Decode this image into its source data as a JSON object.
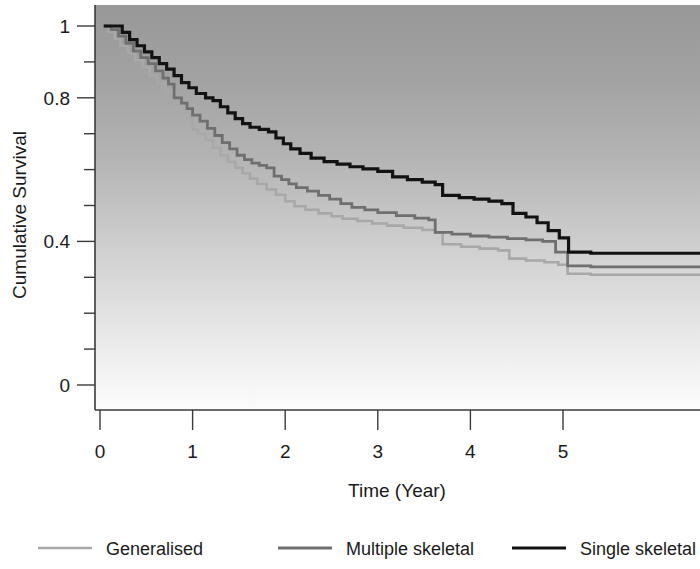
{
  "chart_data": {
    "type": "line",
    "subtype": "kaplan-meier-step",
    "title": "",
    "xlabel": "Time (Year)",
    "ylabel": "Cumulative Survival",
    "xlim": [
      0,
      5.3
    ],
    "ylim": [
      0,
      1.05
    ],
    "xticks": [
      0,
      1,
      2,
      3,
      4,
      5
    ],
    "xtick_labels": [
      "0",
      "1",
      "2",
      "3",
      "4",
      "5"
    ],
    "yticks": [
      0,
      0.1,
      0.2,
      0.3,
      0.4,
      0.5,
      0.6,
      0.7,
      0.8,
      0.9,
      1
    ],
    "ytick_labels_major": [
      "0",
      "0.4",
      "0.8",
      "1"
    ],
    "ytick_major_values": [
      0,
      0.4,
      0.8,
      1
    ],
    "ytick_minor_values": [
      0.1,
      0.2,
      0.3,
      0.5,
      0.6,
      0.7,
      0.9
    ],
    "grid": false,
    "legend_position": "bottom",
    "background": "vertical-gradient-gray-to-white",
    "background_top_color": "#9c9c9c",
    "background_bottom_color": "#fbfbfb",
    "series": [
      {
        "name": "Generalised",
        "color": "#a8a8a8",
        "line_width": 2.6,
        "points": [
          [
            0.04,
            1.0
          ],
          [
            0.1,
            0.985
          ],
          [
            0.16,
            0.965
          ],
          [
            0.22,
            0.945
          ],
          [
            0.3,
            0.925
          ],
          [
            0.38,
            0.905
          ],
          [
            0.46,
            0.885
          ],
          [
            0.54,
            0.862
          ],
          [
            0.62,
            0.84
          ],
          [
            0.7,
            0.818
          ],
          [
            0.78,
            0.8
          ],
          [
            0.86,
            0.782
          ],
          [
            0.92,
            0.762
          ],
          [
            0.98,
            0.745
          ],
          [
            1.0,
            0.712
          ],
          [
            1.06,
            0.7
          ],
          [
            1.14,
            0.682
          ],
          [
            1.22,
            0.66
          ],
          [
            1.3,
            0.64
          ],
          [
            1.38,
            0.622
          ],
          [
            1.46,
            0.605
          ],
          [
            1.54,
            0.59
          ],
          [
            1.62,
            0.575
          ],
          [
            1.7,
            0.56
          ],
          [
            1.8,
            0.545
          ],
          [
            1.9,
            0.53
          ],
          [
            2.0,
            0.512
          ],
          [
            2.1,
            0.498
          ],
          [
            2.22,
            0.488
          ],
          [
            2.36,
            0.478
          ],
          [
            2.5,
            0.47
          ],
          [
            2.62,
            0.463
          ],
          [
            2.78,
            0.457
          ],
          [
            2.94,
            0.45
          ],
          [
            3.1,
            0.444
          ],
          [
            3.28,
            0.438
          ],
          [
            3.48,
            0.432
          ],
          [
            3.62,
            0.425
          ],
          [
            3.7,
            0.392
          ],
          [
            3.9,
            0.385
          ],
          [
            4.1,
            0.38
          ],
          [
            4.3,
            0.375
          ],
          [
            4.42,
            0.352
          ],
          [
            4.6,
            0.347
          ],
          [
            4.8,
            0.342
          ],
          [
            4.95,
            0.335
          ],
          [
            5.05,
            0.31
          ],
          [
            5.3,
            0.307
          ]
        ]
      },
      {
        "name": "Multiple skeletal",
        "color": "#6f6f6f",
        "line_width": 2.8,
        "points": [
          [
            0.04,
            1.0
          ],
          [
            0.12,
            0.99
          ],
          [
            0.2,
            0.972
          ],
          [
            0.28,
            0.952
          ],
          [
            0.36,
            0.93
          ],
          [
            0.44,
            0.912
          ],
          [
            0.52,
            0.895
          ],
          [
            0.6,
            0.875
          ],
          [
            0.68,
            0.855
          ],
          [
            0.74,
            0.838
          ],
          [
            0.8,
            0.8
          ],
          [
            0.88,
            0.785
          ],
          [
            0.94,
            0.77
          ],
          [
            1.0,
            0.752
          ],
          [
            1.08,
            0.735
          ],
          [
            1.16,
            0.715
          ],
          [
            1.24,
            0.695
          ],
          [
            1.32,
            0.675
          ],
          [
            1.4,
            0.658
          ],
          [
            1.48,
            0.64
          ],
          [
            1.56,
            0.628
          ],
          [
            1.64,
            0.618
          ],
          [
            1.72,
            0.612
          ],
          [
            1.8,
            0.605
          ],
          [
            1.88,
            0.582
          ],
          [
            1.96,
            0.572
          ],
          [
            2.04,
            0.56
          ],
          [
            2.12,
            0.55
          ],
          [
            2.24,
            0.54
          ],
          [
            2.36,
            0.528
          ],
          [
            2.48,
            0.518
          ],
          [
            2.6,
            0.505
          ],
          [
            2.72,
            0.495
          ],
          [
            2.86,
            0.488
          ],
          [
            3.0,
            0.48
          ],
          [
            3.2,
            0.472
          ],
          [
            3.4,
            0.465
          ],
          [
            3.55,
            0.46
          ],
          [
            3.62,
            0.425
          ],
          [
            3.8,
            0.42
          ],
          [
            4.0,
            0.415
          ],
          [
            4.2,
            0.412
          ],
          [
            4.4,
            0.408
          ],
          [
            4.6,
            0.404
          ],
          [
            4.78,
            0.4
          ],
          [
            4.92,
            0.37
          ],
          [
            5.05,
            0.332
          ],
          [
            5.3,
            0.329
          ]
        ]
      },
      {
        "name": "Single skeletal",
        "color": "#121212",
        "line_width": 3.2,
        "points": [
          [
            0.04,
            1.0
          ],
          [
            0.16,
            1.0
          ],
          [
            0.24,
            0.982
          ],
          [
            0.32,
            0.962
          ],
          [
            0.4,
            0.945
          ],
          [
            0.48,
            0.928
          ],
          [
            0.56,
            0.912
          ],
          [
            0.64,
            0.895
          ],
          [
            0.72,
            0.88
          ],
          [
            0.8,
            0.862
          ],
          [
            0.88,
            0.842
          ],
          [
            0.96,
            0.828
          ],
          [
            1.04,
            0.812
          ],
          [
            1.14,
            0.8
          ],
          [
            1.22,
            0.792
          ],
          [
            1.3,
            0.775
          ],
          [
            1.38,
            0.758
          ],
          [
            1.46,
            0.742
          ],
          [
            1.54,
            0.728
          ],
          [
            1.62,
            0.718
          ],
          [
            1.72,
            0.712
          ],
          [
            1.82,
            0.705
          ],
          [
            1.9,
            0.688
          ],
          [
            1.98,
            0.672
          ],
          [
            2.06,
            0.658
          ],
          [
            2.16,
            0.645
          ],
          [
            2.28,
            0.632
          ],
          [
            2.42,
            0.622
          ],
          [
            2.56,
            0.615
          ],
          [
            2.7,
            0.608
          ],
          [
            2.84,
            0.602
          ],
          [
            3.0,
            0.595
          ],
          [
            3.16,
            0.58
          ],
          [
            3.32,
            0.572
          ],
          [
            3.48,
            0.565
          ],
          [
            3.62,
            0.558
          ],
          [
            3.7,
            0.528
          ],
          [
            3.88,
            0.522
          ],
          [
            4.04,
            0.518
          ],
          [
            4.2,
            0.512
          ],
          [
            4.34,
            0.505
          ],
          [
            4.46,
            0.478
          ],
          [
            4.6,
            0.468
          ],
          [
            4.72,
            0.452
          ],
          [
            4.84,
            0.43
          ],
          [
            4.96,
            0.41
          ],
          [
            5.06,
            0.37
          ],
          [
            5.3,
            0.367
          ]
        ]
      }
    ]
  },
  "axes": {
    "x_title": "Time (Year)",
    "y_title": "Cumulative Survival",
    "x_tick_labels": [
      "0",
      "1",
      "2",
      "3",
      "4",
      "5"
    ],
    "y_tick_labels": [
      "1",
      "0.8",
      "0.4",
      "0"
    ]
  },
  "legend": {
    "items": [
      {
        "label": "Generalised",
        "color": "#a8a8a8"
      },
      {
        "label": "Multiple skeletal",
        "color": "#6f6f6f"
      },
      {
        "label": "Single skeletal",
        "color": "#121212"
      }
    ]
  }
}
